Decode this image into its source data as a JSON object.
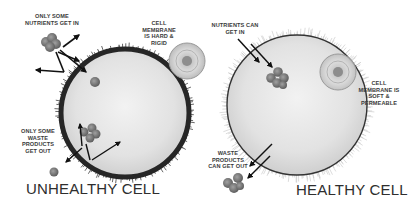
{
  "diagram": {
    "unhealthy": {
      "title": "UNHEALTHY CELL",
      "labels": {
        "nutrients": "ONLY SOME\nNUTRIENTS GET IN",
        "membrane": "CELL\nMEMBRANE\nIS HARD &\nRIGID",
        "waste": "ONLY SOME\nWASTE\nPRODUCTS\nGET OUT"
      }
    },
    "healthy": {
      "title": "HEALTHY CELL",
      "labels": {
        "nutrients": "NUTRIENTS CAN\nGET IN",
        "membrane": "CELL\nMEMBRANE IS\nSOFT &\nPERMEABLE",
        "waste": "WASTE\nPRODUCTS\nCAN GET OUT"
      }
    },
    "colors": {
      "membrane_hard": "#2b2b2b",
      "membrane_soft": "#4a4a4a",
      "cytoplasm": "#e8e8e8",
      "particle": "#7c7c7c",
      "text": "#333333"
    }
  }
}
